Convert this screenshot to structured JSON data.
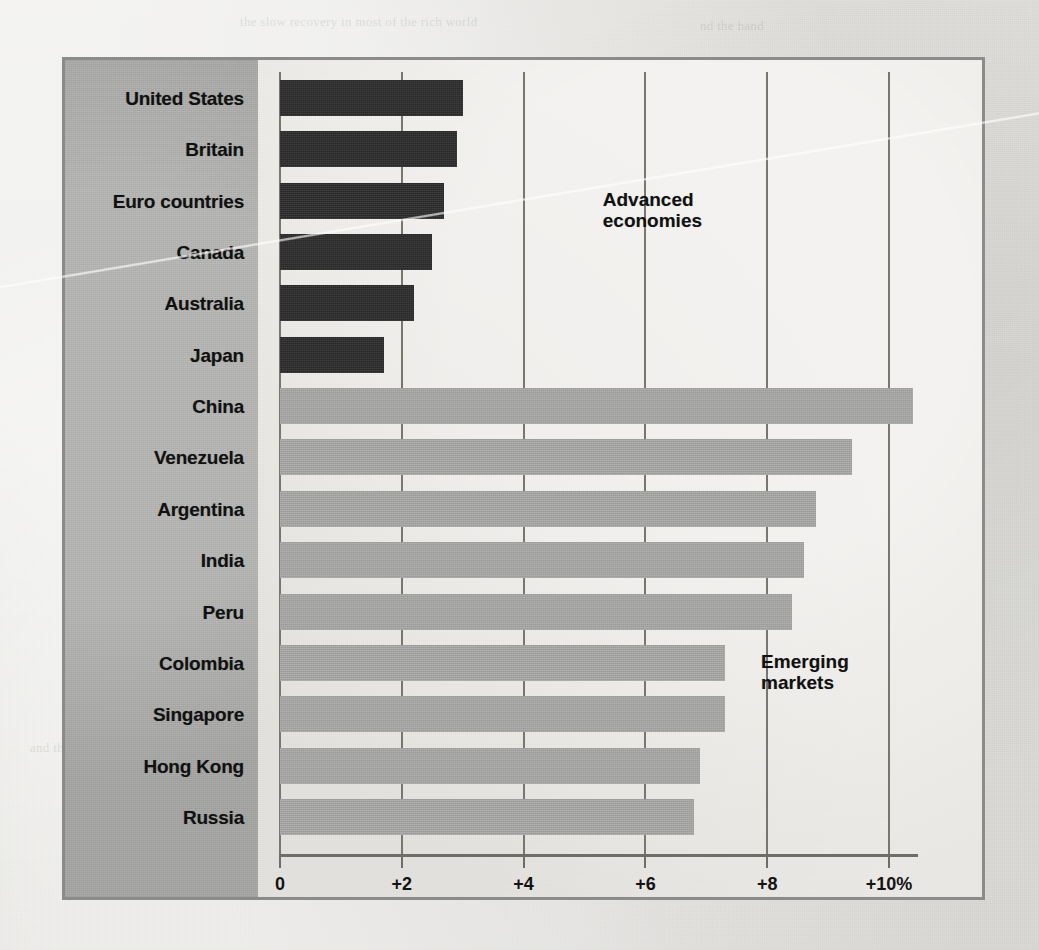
{
  "chart_data": {
    "type": "bar",
    "orientation": "horizontal",
    "title": "",
    "xlabel": "",
    "ylabel": "",
    "xlim": [
      0,
      10.8
    ],
    "grid": true,
    "gridlines_at": [
      0,
      2,
      4,
      6,
      8,
      10
    ],
    "tick_labels": [
      "0",
      "+2",
      "+4",
      "+6",
      "+8",
      "+10%"
    ],
    "tick_values": [
      0,
      2,
      4,
      6,
      8,
      10
    ],
    "categories": [
      "United States",
      "Britain",
      "Euro countries",
      "Canada",
      "Australia",
      "Japan",
      "China",
      "Venezuela",
      "Argentina",
      "India",
      "Peru",
      "Colombia",
      "Singapore",
      "Hong Kong",
      "Russia"
    ],
    "values": [
      3.0,
      2.9,
      2.7,
      2.5,
      2.2,
      1.7,
      10.4,
      9.4,
      8.8,
      8.6,
      8.4,
      7.3,
      7.3,
      6.9,
      6.8
    ],
    "groups": [
      "advanced",
      "advanced",
      "advanced",
      "advanced",
      "advanced",
      "advanced",
      "emerging",
      "emerging",
      "emerging",
      "emerging",
      "emerging",
      "emerging",
      "emerging",
      "emerging",
      "emerging"
    ],
    "annotations": [
      {
        "text": "Advanced\neconomies",
        "x": 5.3,
        "category_index": 2
      },
      {
        "text": "Emerging\nmarkets",
        "x": 7.9,
        "category_index": 11
      }
    ],
    "legend": {
      "position": "inline-annotation"
    },
    "colors": {
      "advanced_bar": "#2b2b2b",
      "emerging_bar": "#a9a9a7",
      "label_panel": "#a6a6a4",
      "plot_background": "#eceae6",
      "frame_border": "#8b8b8b",
      "gridline": "#77776f",
      "axis": "#6e6e68",
      "text": "#111111",
      "page_background": "#e6e5e1"
    }
  },
  "annotations": {
    "advanced": "Advanced\neconomies",
    "emerging": "Emerging\nmarkets"
  },
  "ghost_text": [
    {
      "text": "the slow recovery in most of the rich world",
      "x": 240,
      "y": 14
    },
    {
      "text": "nd the hand",
      "x": 700,
      "y": 18
    },
    {
      "text": "economies have",
      "x": 120,
      "y": 120
    },
    {
      "text": "as the rich world stumbles, the emerging",
      "x": 600,
      "y": 130
    },
    {
      "text": "world has been",
      "x": 640,
      "y": 175
    },
    {
      "text": "growth rates of",
      "x": 640,
      "y": 330
    },
    {
      "text": "an average of",
      "x": 640,
      "y": 376
    },
    {
      "text": "six per cent",
      "x": 640,
      "y": 420
    },
    {
      "text": "and the pace",
      "x": 640,
      "y": 466
    },
    {
      "text": "has not",
      "x": 640,
      "y": 512
    },
    {
      "text": "slowed much",
      "x": 640,
      "y": 558
    },
    {
      "text": "since then",
      "x": 640,
      "y": 604
    },
    {
      "text": "in terms of",
      "x": 640,
      "y": 740
    },
    {
      "text": "output the",
      "x": 640,
      "y": 786
    },
    {
      "text": "gap is wide",
      "x": 640,
      "y": 832
    },
    {
      "text": "and the",
      "x": 30,
      "y": 740
    }
  ]
}
